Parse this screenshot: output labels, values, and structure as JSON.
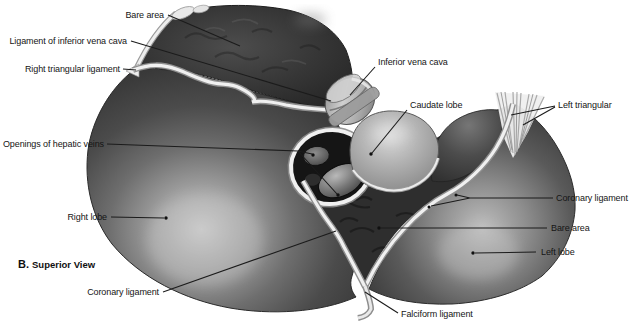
{
  "figure": {
    "caption_letter": "B.",
    "caption_title": "Superior View"
  },
  "labels": {
    "bare_area_top": "Bare area",
    "ligament_of_inferior_vena_cava": "Ligament of inferior vena cava",
    "right_triangular_ligament": "Right triangular ligament",
    "openings_of_hepatic_veins": "Openings of hepatic veins",
    "right_lobe": "Right lobe",
    "coronary_ligament_lower": "Coronary ligament",
    "inferior_vena_cava": "Inferior vena cava",
    "caudate_lobe": "Caudate lobe",
    "left_triangular": "Left triangular",
    "coronary_ligament_right": "Coronary ligament",
    "bare_area_central": "Bare area",
    "left_lobe": "Left lobe",
    "falciform_ligament": "Falciform ligament"
  },
  "colors": {
    "background": "#ffffff",
    "label_text": "#151515",
    "leader_line": "#1b1b1b",
    "ligament_white": "#f0f0f0",
    "liver_dark": "#383838",
    "liver_highlight": "#c6c6c6"
  }
}
